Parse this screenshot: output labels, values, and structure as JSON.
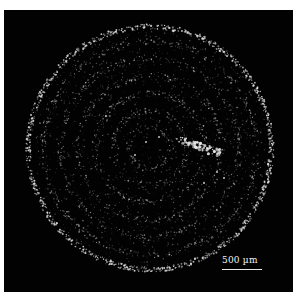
{
  "image": {
    "description": "Dark-field microscopy image of circular sample with concentric ring pattern and bright particle cluster",
    "background_color": "#020202",
    "border_color": "#ffffff",
    "feature_color": "#e6e6e6"
  },
  "scale_bar": {
    "label": "500 µm",
    "length_px": 40
  },
  "sample": {
    "shape": "circle",
    "center_px": [
      150,
      148
    ],
    "radius_px": 124,
    "ring_count": 6
  }
}
